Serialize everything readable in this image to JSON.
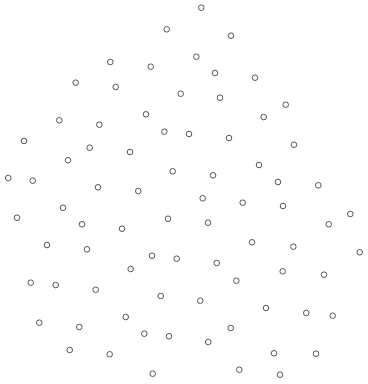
{
  "chart_data": {
    "type": "scatter",
    "title": "",
    "xlabel": "",
    "ylabel": "",
    "grid": false,
    "axes_visible": false,
    "legend": null,
    "xlim": [
      0,
      368
    ],
    "ylim": [
      0,
      384
    ],
    "marker": {
      "shape": "open-circle",
      "radius": 2.8,
      "stroke": "#555555",
      "stroke_width": 1,
      "fill": "none"
    },
    "series": [
      {
        "name": "points",
        "points": [
          [
            201.3,
            7.7
          ],
          [
            166.7,
            29.3
          ],
          [
            231.0,
            35.7
          ],
          [
            196.3,
            56.7
          ],
          [
            110.3,
            62.0
          ],
          [
            150.7,
            66.7
          ],
          [
            215.0,
            73.0
          ],
          [
            255.0,
            77.7
          ],
          [
            75.7,
            82.7
          ],
          [
            115.7,
            87.0
          ],
          [
            180.7,
            93.7
          ],
          [
            220.0,
            97.7
          ],
          [
            285.7,
            104.7
          ],
          [
            146.0,
            114.3
          ],
          [
            263.7,
            117.0
          ],
          [
            59.3,
            120.3
          ],
          [
            99.3,
            124.7
          ],
          [
            164.3,
            131.7
          ],
          [
            189.0,
            134.0
          ],
          [
            229.0,
            138.0
          ],
          [
            24.0,
            141.0
          ],
          [
            294.0,
            144.7
          ],
          [
            89.7,
            147.7
          ],
          [
            130.0,
            152.0
          ],
          [
            68.0,
            160.3
          ],
          [
            259.0,
            165.0
          ],
          [
            172.7,
            171.3
          ],
          [
            213.0,
            175.3
          ],
          [
            8.3,
            178.0
          ],
          [
            32.7,
            180.7
          ],
          [
            278.0,
            182.0
          ],
          [
            318.3,
            185.3
          ],
          [
            98.0,
            187.3
          ],
          [
            138.3,
            191.0
          ],
          [
            202.7,
            198.3
          ],
          [
            242.7,
            202.7
          ],
          [
            283.0,
            206.0
          ],
          [
            63.0,
            207.7
          ],
          [
            350.3,
            214.0
          ],
          [
            17.0,
            217.7
          ],
          [
            168.0,
            218.7
          ],
          [
            208.0,
            222.7
          ],
          [
            82.0,
            224.3
          ],
          [
            328.7,
            224.3
          ],
          [
            122.0,
            228.7
          ],
          [
            252.0,
            242.3
          ],
          [
            47.0,
            245.0
          ],
          [
            293.3,
            246.7
          ],
          [
            87.0,
            249.3
          ],
          [
            359.7,
            252.3
          ],
          [
            152.0,
            255.7
          ],
          [
            176.7,
            258.7
          ],
          [
            216.7,
            263.0
          ],
          [
            130.7,
            269.0
          ],
          [
            282.7,
            271.3
          ],
          [
            324.0,
            274.7
          ],
          [
            236.3,
            280.7
          ],
          [
            30.7,
            282.7
          ],
          [
            55.7,
            285.0
          ],
          [
            95.7,
            289.7
          ],
          [
            160.7,
            296.0
          ],
          [
            200.3,
            300.7
          ],
          [
            266.0,
            308.0
          ],
          [
            306.3,
            313.0
          ],
          [
            332.7,
            315.7
          ],
          [
            125.7,
            317.0
          ],
          [
            39.3,
            322.7
          ],
          [
            79.3,
            327.0
          ],
          [
            230.7,
            328.0
          ],
          [
            144.3,
            333.7
          ],
          [
            169.0,
            336.3
          ],
          [
            208.3,
            342.0
          ],
          [
            69.7,
            350.0
          ],
          [
            274.0,
            353.3
          ],
          [
            316.0,
            353.7
          ],
          [
            109.7,
            354.3
          ],
          [
            239.3,
            369.7
          ],
          [
            152.7,
            373.7
          ],
          [
            280.0,
            374.7
          ]
        ]
      }
    ]
  }
}
